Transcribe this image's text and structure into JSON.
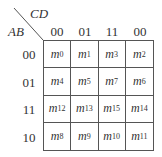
{
  "kmap": {
    "col_variable": "CD",
    "row_variable": "AB",
    "col_headers": [
      "00",
      "01",
      "11",
      "00"
    ],
    "row_headers": [
      "00",
      "01",
      "11",
      "10"
    ],
    "cells": [
      [
        {
          "m": "m",
          "i": "0"
        },
        {
          "m": "m",
          "i": "1"
        },
        {
          "m": "m",
          "i": "3"
        },
        {
          "m": "m",
          "i": "2"
        }
      ],
      [
        {
          "m": "m",
          "i": "4"
        },
        {
          "m": "m",
          "i": "5"
        },
        {
          "m": "m",
          "i": "7"
        },
        {
          "m": "m",
          "i": "6"
        }
      ],
      [
        {
          "m": "m",
          "i": "12"
        },
        {
          "m": "m",
          "i": "13"
        },
        {
          "m": "m",
          "i": "15"
        },
        {
          "m": "m",
          "i": "14"
        }
      ],
      [
        {
          "m": "m",
          "i": "8"
        },
        {
          "m": "m",
          "i": "9"
        },
        {
          "m": "m",
          "i": "10"
        },
        {
          "m": "m",
          "i": "11"
        }
      ]
    ]
  }
}
